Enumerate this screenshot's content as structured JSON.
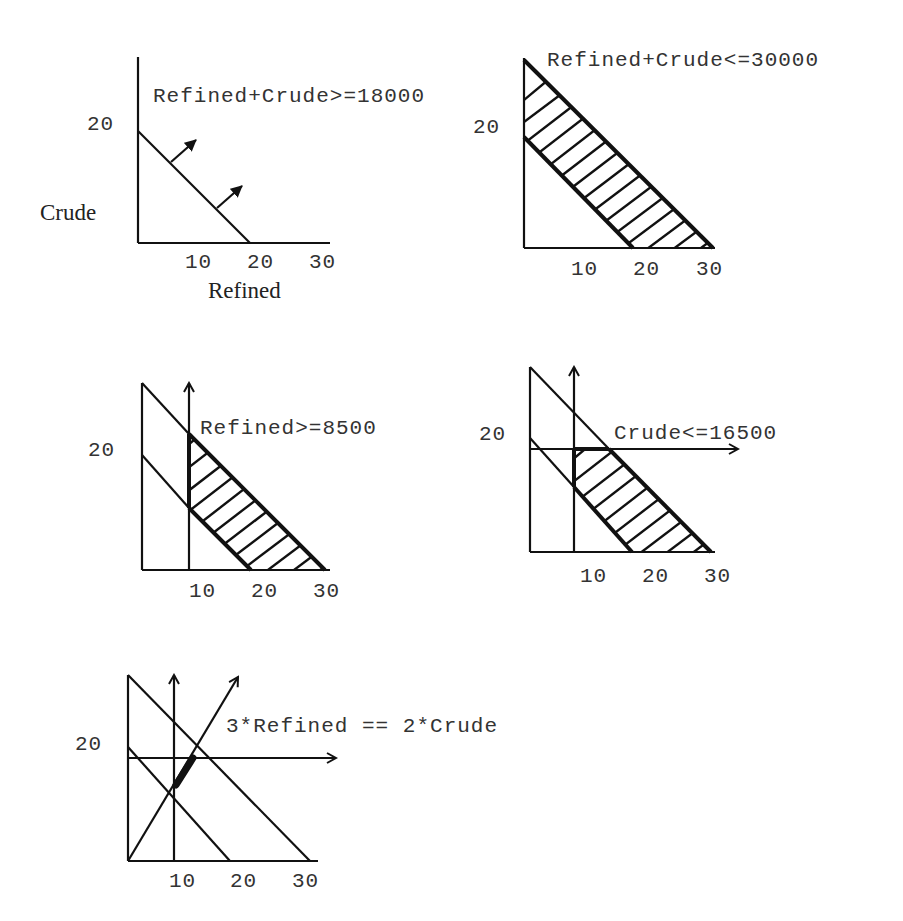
{
  "axis_labels": {
    "y": "Crude",
    "x": "Refined"
  },
  "ticks": {
    "x": [
      "10",
      "20",
      "30"
    ],
    "y": [
      "20"
    ]
  },
  "panels": [
    {
      "id": "p1",
      "label": "Refined+Crude>=18000",
      "description": "Line Refined+Crude=18 with arrows pointing to feasible side"
    },
    {
      "id": "p2",
      "label": "Refined+Crude<=30000",
      "description": "Hatched band between Refined+Crude=18 and Refined+Crude=30"
    },
    {
      "id": "p3",
      "label": "Refined>=8500",
      "description": "Vertical line Refined=8.5 restricts hatched band"
    },
    {
      "id": "p4",
      "label": "Crude<=16500",
      "description": "Horizontal line Crude=16.5 further restricts hatched region"
    },
    {
      "id": "p5",
      "label": "3*Refined == 2*Crude",
      "description": "Line 3R=2C; feasible set is bold segment within region"
    }
  ],
  "colors": {
    "ink": "#111111",
    "text": "#333333",
    "background": "#ffffff"
  }
}
